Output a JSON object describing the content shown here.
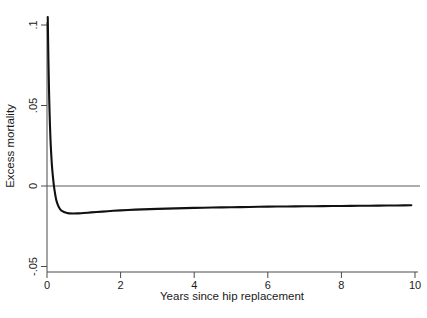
{
  "chart_data": {
    "type": "line",
    "title": "",
    "subtitle": "",
    "xlabel": "Years since hip replacement",
    "ylabel": "Excess mortality",
    "xlim": [
      0,
      10
    ],
    "ylim": [
      -0.05,
      0.1
    ],
    "xticks": [
      0,
      2,
      4,
      6,
      8,
      10
    ],
    "xtick_labels": [
      "0",
      "2",
      "4",
      "6",
      "8",
      "10"
    ],
    "yticks": [
      -0.05,
      0,
      0.05,
      0.1
    ],
    "ytick_labels": [
      "-.05",
      "0",
      ".05",
      ".1"
    ],
    "grid": false,
    "legend": null,
    "reference_lines": [
      {
        "name": "zero-line",
        "axis": "y",
        "value": 0,
        "color": "#5a5a5a"
      }
    ],
    "series": [
      {
        "name": "Excess mortality",
        "color": "#111111",
        "x": [
          0.02,
          0.04,
          0.06,
          0.08,
          0.1,
          0.13,
          0.16,
          0.2,
          0.25,
          0.3,
          0.36,
          0.43,
          0.5,
          0.6,
          0.7,
          0.85,
          1.0,
          1.2,
          1.5,
          1.8,
          2.2,
          2.6,
          3.0,
          3.5,
          4.0,
          4.5,
          5.0,
          5.5,
          6.0,
          6.5,
          7.0,
          7.5,
          8.0,
          8.5,
          9.0,
          9.5,
          9.9
        ],
        "y": [
          0.105,
          0.076,
          0.054,
          0.038,
          0.026,
          0.014,
          0.006,
          -0.002,
          -0.0085,
          -0.012,
          -0.0145,
          -0.0158,
          -0.0165,
          -0.017,
          -0.0171,
          -0.017,
          -0.0168,
          -0.0164,
          -0.0159,
          -0.0154,
          -0.0149,
          -0.0145,
          -0.0142,
          -0.0139,
          -0.0136,
          -0.0134,
          -0.0132,
          -0.013,
          -0.0128,
          -0.0127,
          -0.0126,
          -0.0125,
          -0.0124,
          -0.0123,
          -0.0122,
          -0.0121,
          -0.012
        ]
      }
    ]
  },
  "figure": {
    "background_color": "#ffffff",
    "axis_color": "#4a4a4a",
    "curve_color": "#111111"
  }
}
